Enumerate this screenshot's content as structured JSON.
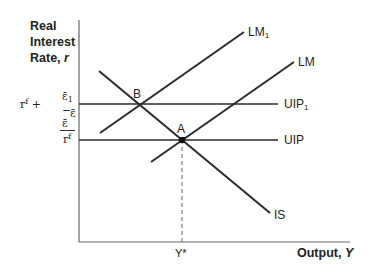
{
  "axes": {
    "y_label_line1": "Real",
    "y_label_line2": "Interest",
    "y_label_line3": "Rate, r",
    "x_label": "Output, Y"
  },
  "y_ticks": {
    "rf_label": "rf",
    "rf_plus": "rf +",
    "frac_num": "ε̄1 − ε̄",
    "frac_den": "ε̄"
  },
  "curves": {
    "lm1": "LM1",
    "lm": "LM",
    "uip1": "UIP1",
    "uip": "UIP",
    "is": "IS"
  },
  "points": {
    "a": "A",
    "b": "B"
  },
  "x_ticks": {
    "ystar": "Y*"
  },
  "colors": {
    "line": "#2a2a2a",
    "axis": "#555555"
  }
}
